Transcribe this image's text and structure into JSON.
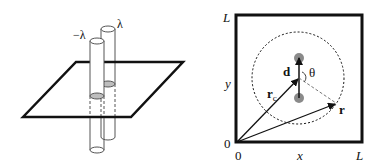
{
  "left_panel": {
    "label_neg": "−λ",
    "label_pos": "λ"
  },
  "right_panel": {
    "corner_top": "L",
    "corner_right": "L",
    "origin_y": "0",
    "origin_x": "0",
    "axis_x": "x",
    "axis_y": "y",
    "vector_d": "d",
    "angle": "θ",
    "vector_rc_main": "r",
    "vector_rc_sub": "c",
    "vector_r": "r"
  },
  "colors": {
    "stroke": "#111111",
    "dot": "#8a8a8a",
    "ellipse_fill": "#bdbdbd"
  }
}
